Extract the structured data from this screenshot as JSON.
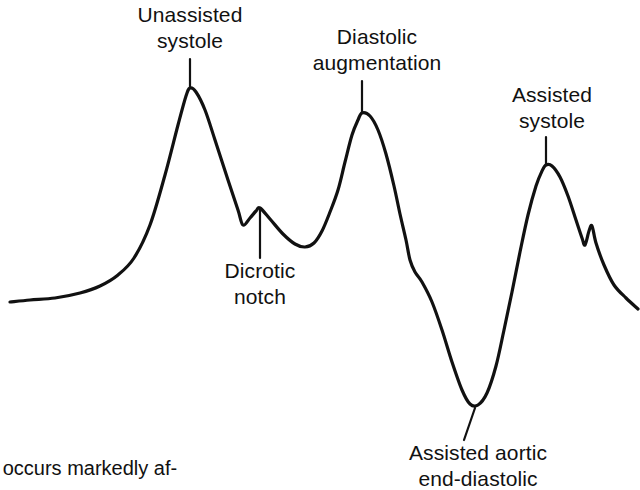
{
  "figure": {
    "background_color": "#ffffff",
    "trace_color": "#111111"
  },
  "annotations": [
    {
      "name": "unassisted-systole",
      "line1": "Unassisted",
      "line2": "systole"
    },
    {
      "name": "diastolic-augmentation",
      "line1": "Diastolic",
      "line2": "augmentation"
    },
    {
      "name": "assisted-systole",
      "line1": "Assisted",
      "line2": "systole"
    },
    {
      "name": "dicrotic-notch",
      "line1": "Dicrotic",
      "line2": "notch"
    },
    {
      "name": "assisted-aortic-end-diastolic",
      "line1": "Assisted aortic",
      "line2": "end-diastolic"
    }
  ],
  "caption": {
    "text": "n occurs markedly af-"
  },
  "chart_data": {
    "type": "line",
    "title": "",
    "xlabel": "",
    "ylabel": "",
    "xlim": [
      0,
      640
    ],
    "ylim": [
      430,
      60
    ],
    "grid": false,
    "legend": "none",
    "series": [
      {
        "name": "arterial-pressure-trace",
        "points": [
          [
            10,
            302
          ],
          [
            30,
            300
          ],
          [
            55,
            298
          ],
          [
            80,
            293
          ],
          [
            100,
            286
          ],
          [
            118,
            275
          ],
          [
            134,
            258
          ],
          [
            150,
            225
          ],
          [
            165,
            175
          ],
          [
            178,
            125
          ],
          [
            186,
            96
          ],
          [
            190,
            88
          ],
          [
            196,
            92
          ],
          [
            205,
            110
          ],
          [
            215,
            140
          ],
          [
            228,
            180
          ],
          [
            238,
            210
          ],
          [
            243,
            225
          ],
          [
            250,
            218
          ],
          [
            256,
            211
          ],
          [
            260,
            208
          ],
          [
            270,
            219
          ],
          [
            283,
            234
          ],
          [
            295,
            244
          ],
          [
            305,
            247
          ],
          [
            314,
            243
          ],
          [
            322,
            231
          ],
          [
            330,
            212
          ],
          [
            338,
            190
          ],
          [
            345,
            162
          ],
          [
            352,
            135
          ],
          [
            358,
            120
          ],
          [
            362,
            113
          ],
          [
            370,
            116
          ],
          [
            378,
            130
          ],
          [
            386,
            154
          ],
          [
            394,
            186
          ],
          [
            400,
            214
          ],
          [
            406,
            240
          ],
          [
            410,
            260
          ],
          [
            415,
            272
          ],
          [
            422,
            282
          ],
          [
            432,
            302
          ],
          [
            442,
            330
          ],
          [
            452,
            362
          ],
          [
            462,
            390
          ],
          [
            470,
            404
          ],
          [
            478,
            405
          ],
          [
            487,
            393
          ],
          [
            496,
            366
          ],
          [
            504,
            330
          ],
          [
            512,
            292
          ],
          [
            520,
            252
          ],
          [
            528,
            215
          ],
          [
            536,
            186
          ],
          [
            542,
            171
          ],
          [
            546,
            165
          ],
          [
            552,
            166
          ],
          [
            560,
            177
          ],
          [
            568,
            196
          ],
          [
            576,
            220
          ],
          [
            582,
            238
          ],
          [
            585,
            245
          ],
          [
            589,
            231
          ],
          [
            592,
            226
          ],
          [
            596,
            243
          ],
          [
            604,
            265
          ],
          [
            614,
            285
          ],
          [
            626,
            298
          ],
          [
            638,
            309
          ]
        ]
      }
    ],
    "leader_lines": [
      {
        "name": "leader-unassisted-systole",
        "x1": 190,
        "y1": 59,
        "x2": 190,
        "y2": 88
      },
      {
        "name": "leader-diastolic-augmentation",
        "x1": 362,
        "y1": 81,
        "x2": 362,
        "y2": 113
      },
      {
        "name": "leader-assisted-systole",
        "x1": 546,
        "y1": 137,
        "x2": 546,
        "y2": 165
      },
      {
        "name": "leader-dicrotic-notch",
        "x1": 260,
        "y1": 208,
        "x2": 260,
        "y2": 258
      },
      {
        "name": "leader-assisted-aortic-ed",
        "x1": 475,
        "y1": 408,
        "x2": 464,
        "y2": 440
      }
    ]
  }
}
